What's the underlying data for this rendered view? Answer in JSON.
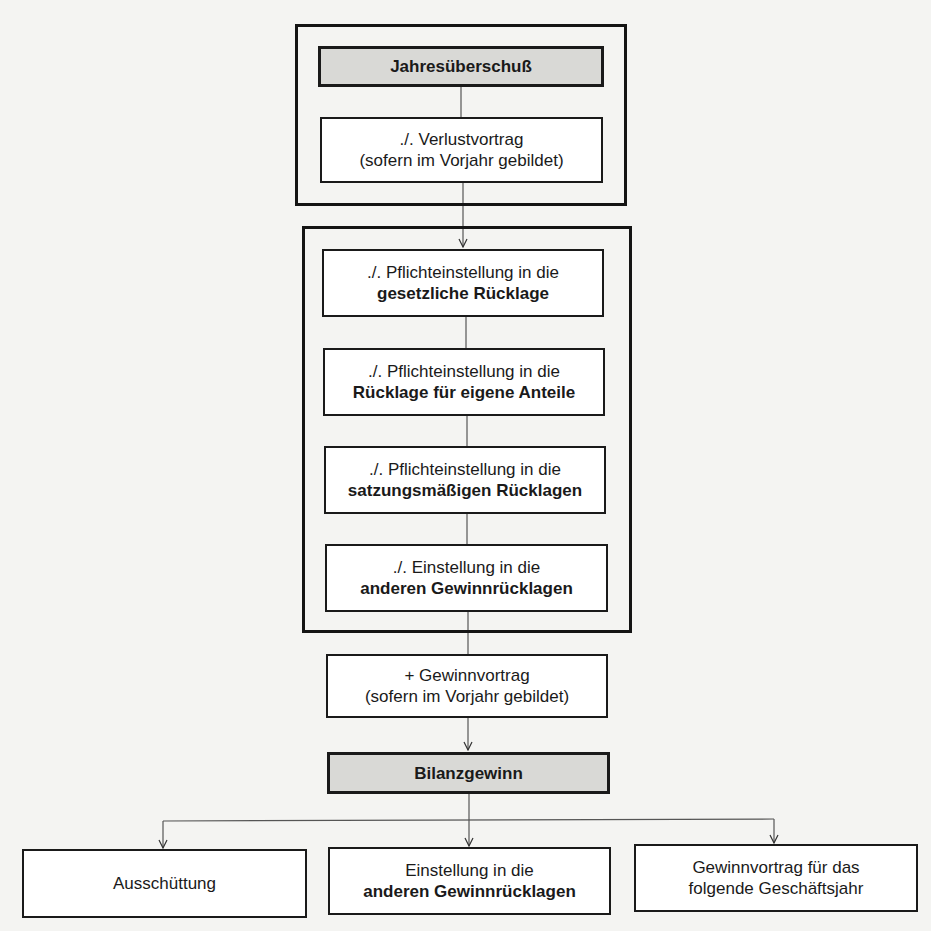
{
  "diagram": {
    "type": "flowchart",
    "nodes": {
      "jahresueberschuss": {
        "label": "Jahresüberschuß"
      },
      "verlustvortrag": {
        "line1": "./. Verlustvortrag",
        "line2": "(sofern im Vorjahr gebildet)"
      },
      "gesetzliche": {
        "line1": "./. Pflichteinstellung in die",
        "line2": "gesetzliche Rücklage"
      },
      "eigene_anteile": {
        "line1": "./. Pflichteinstellung in die",
        "line2": "Rücklage für eigene Anteile"
      },
      "satzungsmaessige": {
        "line1": "./. Pflichteinstellung in die",
        "line2": "satzungsmäßigen Rücklagen"
      },
      "andere_gewinnruecklagen": {
        "line1": "./. Einstellung in die",
        "line2": "anderen Gewinnrücklagen"
      },
      "gewinnvortrag": {
        "line1": "+ Gewinnvortrag",
        "line2": "(sofern im Vorjahr gebildet)"
      },
      "bilanzgewinn": {
        "label": "Bilanzgewinn"
      },
      "ausschuettung": {
        "label": "Ausschüttung"
      },
      "einstellung_andere": {
        "line1": "Einstellung in die",
        "line2": "anderen Gewinnrücklagen"
      },
      "gewinnvortrag_folgend": {
        "line1": "Gewinnvortrag für das",
        "line2": "folgende Geschäftsjahr"
      }
    },
    "edges": [
      [
        "jahresueberschuss",
        "verlustvortrag"
      ],
      [
        "verlustvortrag",
        "gesetzliche"
      ],
      [
        "gesetzliche",
        "eigene_anteile"
      ],
      [
        "eigene_anteile",
        "satzungsmaessige"
      ],
      [
        "satzungsmaessige",
        "andere_gewinnruecklagen"
      ],
      [
        "andere_gewinnruecklagen",
        "gewinnvortrag"
      ],
      [
        "gewinnvortrag",
        "bilanzgewinn"
      ],
      [
        "bilanzgewinn",
        "ausschuettung"
      ],
      [
        "bilanzgewinn",
        "einstellung_andere"
      ],
      [
        "bilanzgewinn",
        "gewinnvortrag_folgend"
      ]
    ],
    "colors": {
      "highlight_fill": "#d9d9d6",
      "box_fill": "#ffffff",
      "stroke": "#1a1a1a"
    }
  }
}
